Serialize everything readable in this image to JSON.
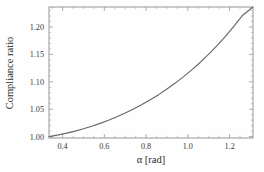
{
  "chart_data": {
    "type": "line",
    "title": "",
    "xlabel": "α [rad]",
    "ylabel": "Compliance ratio",
    "xlim": [
      0.335,
      1.312
    ],
    "ylim": [
      0.9975,
      1.2365
    ],
    "grid": false,
    "legend": null,
    "xticks": [
      0.4,
      0.6,
      0.8,
      1.0,
      1.2
    ],
    "xticklabels": [
      "0.4",
      "0.6",
      "0.8",
      "1.0",
      "1.2"
    ],
    "yticks": [
      1.0,
      1.05,
      1.1,
      1.15,
      1.2
    ],
    "yticklabels": [
      "1.00",
      "1.05",
      "1.10",
      "1.15",
      "1.20"
    ],
    "x_minor_step": 0.05,
    "y_minor_step": 0.01,
    "series": [
      {
        "name": "compliance ratio",
        "color": "#676767",
        "x": [
          0.335,
          0.38,
          0.42,
          0.46,
          0.5,
          0.54,
          0.58,
          0.62,
          0.66,
          0.7,
          0.74,
          0.78,
          0.82,
          0.86,
          0.9,
          0.94,
          0.98,
          1.02,
          1.06,
          1.1,
          1.14,
          1.18,
          1.22,
          1.26,
          1.312
        ],
        "y": [
          1.0,
          1.0032,
          1.0064,
          1.0101,
          1.0143,
          1.019,
          1.0242,
          1.0299,
          1.0362,
          1.043,
          1.0504,
          1.0585,
          1.0672,
          1.0766,
          1.0868,
          1.0977,
          1.1095,
          1.1222,
          1.1358,
          1.1504,
          1.1661,
          1.183,
          1.201,
          1.2204,
          1.2365
        ]
      }
    ]
  },
  "axes": {
    "y_title": "Compliance ratio",
    "x_title": "α [rad]"
  }
}
